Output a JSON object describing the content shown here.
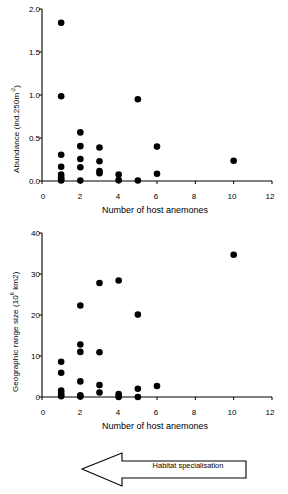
{
  "figure": {
    "background_color": "#ffffff",
    "marker_color": "#000000",
    "axis_color": "#000000"
  },
  "annotation": {
    "arrow_label": "Habitat specialisation",
    "arrow_direction": "left",
    "name": "habitat-specialisation-arrow"
  },
  "chart_data": [
    {
      "type": "scatter",
      "id": "abundance-vs-host-anemones",
      "title": "",
      "xlabel": "Number of host anemones",
      "ylabel": "Abundance (ind.250m-2)",
      "ylabel_prefix": "Abundance (ind.250m",
      "ylabel_sup": "-2",
      "ylabel_suffix": ")",
      "xlim": [
        0,
        12
      ],
      "ylim": [
        0,
        2.0
      ],
      "xticks": [
        0,
        2,
        4,
        6,
        8,
        10,
        12
      ],
      "xtick_labels": [
        "0",
        "2",
        "4",
        "6",
        "8",
        "10",
        "12"
      ],
      "yticks": [
        0.0,
        0.5,
        1.0,
        1.5,
        2.0
      ],
      "ytick_labels": [
        "0.0",
        "0.5",
        "1.0",
        "1.5",
        "2.0"
      ],
      "grid": false,
      "legend": false,
      "points": [
        {
          "x": 1,
          "y": 1.84
        },
        {
          "x": 1,
          "y": 0.985
        },
        {
          "x": 1,
          "y": 0.305
        },
        {
          "x": 1,
          "y": 0.165
        },
        {
          "x": 1,
          "y": 0.075
        },
        {
          "x": 1,
          "y": 0.045
        },
        {
          "x": 1,
          "y": 0.02
        },
        {
          "x": 1,
          "y": 0.005
        },
        {
          "x": 2,
          "y": 0.565
        },
        {
          "x": 2,
          "y": 0.405
        },
        {
          "x": 2,
          "y": 0.255
        },
        {
          "x": 2,
          "y": 0.16
        },
        {
          "x": 2,
          "y": 0.005
        },
        {
          "x": 3,
          "y": 0.39
        },
        {
          "x": 3,
          "y": 0.23
        },
        {
          "x": 3,
          "y": 0.115
        },
        {
          "x": 3,
          "y": 0.09
        },
        {
          "x": 4,
          "y": 0.075
        },
        {
          "x": 4,
          "y": 0.01
        },
        {
          "x": 5,
          "y": 0.95
        },
        {
          "x": 5,
          "y": 0.005
        },
        {
          "x": 6,
          "y": 0.4
        },
        {
          "x": 6,
          "y": 0.085
        },
        {
          "x": 10,
          "y": 0.235
        }
      ]
    },
    {
      "type": "scatter",
      "id": "geographic-range-size-vs-host-anemones",
      "title": "",
      "xlabel": "Number of host anemones",
      "ylabel": "Geographic range size (106 km2)",
      "ylabel_prefix": "Geographic range size (10",
      "ylabel_sup": "6",
      "ylabel_suffix": " km2)",
      "xlim": [
        0,
        12
      ],
      "ylim": [
        0,
        40
      ],
      "xticks": [
        0,
        2,
        4,
        6,
        8,
        10,
        12
      ],
      "xtick_labels": [
        "0",
        "2",
        "4",
        "6",
        "8",
        "10",
        "12"
      ],
      "yticks": [
        0,
        10,
        20,
        30,
        40
      ],
      "ytick_labels": [
        "0",
        "10",
        "20",
        "30",
        "40"
      ],
      "grid": false,
      "legend": false,
      "points": [
        {
          "x": 1,
          "y": 8.6
        },
        {
          "x": 1,
          "y": 5.9
        },
        {
          "x": 1,
          "y": 1.6
        },
        {
          "x": 1,
          "y": 1.0
        },
        {
          "x": 1,
          "y": 0.5
        },
        {
          "x": 1,
          "y": 0.2
        },
        {
          "x": 2,
          "y": 22.3
        },
        {
          "x": 2,
          "y": 12.8
        },
        {
          "x": 2,
          "y": 11.0
        },
        {
          "x": 2,
          "y": 3.8
        },
        {
          "x": 2,
          "y": 0.4
        },
        {
          "x": 2,
          "y": 0.1
        },
        {
          "x": 3,
          "y": 27.8
        },
        {
          "x": 3,
          "y": 10.9
        },
        {
          "x": 3,
          "y": 2.9
        },
        {
          "x": 3,
          "y": 1.1
        },
        {
          "x": 4,
          "y": 28.4
        },
        {
          "x": 4,
          "y": 0.7
        },
        {
          "x": 4,
          "y": 0.0
        },
        {
          "x": 5,
          "y": 20.1
        },
        {
          "x": 5,
          "y": 2.0
        },
        {
          "x": 5,
          "y": 0.0
        },
        {
          "x": 6,
          "y": 2.7
        },
        {
          "x": 10,
          "y": 34.7
        }
      ]
    }
  ]
}
